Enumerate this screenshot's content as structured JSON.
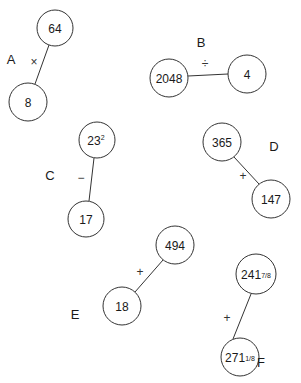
{
  "colors": {
    "stroke": "#333333",
    "text": "#1a1a1a",
    "background": "#ffffff"
  },
  "problems": [
    {
      "label": "A",
      "operator": "×",
      "top": "64",
      "bottom": "8"
    },
    {
      "label": "B",
      "operator": "÷",
      "left": "2048",
      "right": "4"
    },
    {
      "label": "C",
      "operator": "−",
      "top_base": "23",
      "top_exp": "2",
      "bottom": "17"
    },
    {
      "label": "D",
      "operator": "+",
      "top": "365",
      "bottom": "147"
    },
    {
      "label": "E",
      "operator": "+",
      "top": "494",
      "bottom": "18"
    },
    {
      "label": "F",
      "operator": "+",
      "top_whole": "241",
      "top_frac": "7/8",
      "bottom_whole": "271",
      "bottom_frac": "1/8"
    }
  ]
}
